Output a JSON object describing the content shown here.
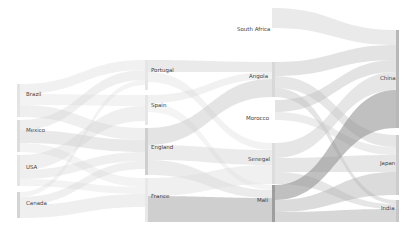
{
  "chart_data": {
    "type": "sankey",
    "title": "",
    "columns": [
      [
        "Brazil",
        "Mexico",
        "USA",
        "Canada"
      ],
      [
        "Portugal",
        "Spain",
        "England",
        "France"
      ],
      [
        "South Africa",
        "Angola",
        "Morocco",
        "Senegal",
        "Mali"
      ],
      [
        "China",
        "Japan",
        "India"
      ]
    ],
    "nodes": [
      {
        "name": "Brazil",
        "col": 0,
        "x": 17,
        "y0": 84,
        "y1": 117,
        "color": "#e4e4e4",
        "lx": 26,
        "ly": 94
      },
      {
        "name": "Mexico",
        "col": 0,
        "x": 17,
        "y0": 120,
        "y1": 152,
        "color": "#dcdcdc",
        "lx": 26,
        "ly": 130
      },
      {
        "name": "USA",
        "col": 0,
        "x": 17,
        "y0": 155,
        "y1": 186,
        "color": "#e4e4e4",
        "lx": 26,
        "ly": 167
      },
      {
        "name": "Canada",
        "col": 0,
        "x": 17,
        "y0": 192,
        "y1": 218,
        "color": "#d4d4d4",
        "lx": 26,
        "ly": 203
      },
      {
        "name": "Portugal",
        "col": 1,
        "x": 145,
        "y0": 60,
        "y1": 90,
        "color": "#e6e6e6",
        "lx": 151,
        "ly": 70
      },
      {
        "name": "Spain",
        "col": 1,
        "x": 145,
        "y0": 95,
        "y1": 125,
        "color": "#e6e6e6",
        "lx": 151,
        "ly": 105
      },
      {
        "name": "England",
        "col": 1,
        "x": 145,
        "y0": 128,
        "y1": 175,
        "color": "#cfcfcf",
        "lx": 151,
        "ly": 147
      },
      {
        "name": "France",
        "col": 1,
        "x": 145,
        "y0": 178,
        "y1": 222,
        "color": "#e8e8e8",
        "lx": 151,
        "ly": 196
      },
      {
        "name": "South Africa",
        "col": 2,
        "x": 272,
        "y0": 28,
        "y1": 28,
        "color": "#ffffff",
        "lx": 237,
        "ly": 29
      },
      {
        "name": "Angola",
        "col": 2,
        "x": 272,
        "y0": 62,
        "y1": 97,
        "color": "#d8d8d8",
        "lx": 249,
        "ly": 76
      },
      {
        "name": "Morocco",
        "col": 2,
        "x": 272,
        "y0": 118,
        "y1": 118,
        "color": "#ffffff",
        "lx": 246,
        "ly": 118
      },
      {
        "name": "Senegal",
        "col": 2,
        "x": 272,
        "y0": 143,
        "y1": 184,
        "color": "#dddddd",
        "lx": 248,
        "ly": 159
      },
      {
        "name": "Mali",
        "col": 2,
        "x": 272,
        "y0": 185,
        "y1": 222,
        "color": "#9e9e9e",
        "lx": 257,
        "ly": 200
      },
      {
        "name": "China",
        "col": 3,
        "x": 396,
        "y0": 30,
        "y1": 128,
        "color": "#b8b8b8",
        "lx": 380,
        "ly": 78
      },
      {
        "name": "Japan",
        "col": 3,
        "x": 396,
        "y0": 135,
        "y1": 195,
        "color": "#cdcdcd",
        "lx": 380,
        "ly": 163
      },
      {
        "name": "India",
        "col": 3,
        "x": 396,
        "y0": 200,
        "y1": 222,
        "color": "#c6c6c6",
        "lx": 381,
        "ly": 208
      }
    ],
    "links": [
      {
        "source": "Brazil",
        "target": "Portugal",
        "sx": 20,
        "tx": 145,
        "s0": 84,
        "s1": 94,
        "t0": 60,
        "t1": 70,
        "color": "#d8d8d8",
        "opacity": 0.35
      },
      {
        "source": "Brazil",
        "target": "Spain",
        "sx": 20,
        "tx": 145,
        "s0": 94,
        "s1": 105,
        "t0": 95,
        "t1": 106,
        "color": "#d8d8d8",
        "opacity": 0.3
      },
      {
        "source": "Brazil",
        "target": "England",
        "sx": 20,
        "tx": 145,
        "s0": 105,
        "s1": 117,
        "t0": 128,
        "t1": 140,
        "color": "#d0d0d0",
        "opacity": 0.35
      },
      {
        "source": "Mexico",
        "target": "Portugal",
        "sx": 20,
        "tx": 145,
        "s0": 120,
        "s1": 130,
        "t0": 70,
        "t1": 80,
        "color": "#d0d0d0",
        "opacity": 0.35
      },
      {
        "source": "Mexico",
        "target": "England",
        "sx": 20,
        "tx": 145,
        "s0": 130,
        "s1": 143,
        "t0": 140,
        "t1": 152,
        "color": "#c8c8c8",
        "opacity": 0.4
      },
      {
        "source": "Mexico",
        "target": "France",
        "sx": 20,
        "tx": 145,
        "s0": 143,
        "s1": 152,
        "t0": 178,
        "t1": 187,
        "color": "#d8d8d8",
        "opacity": 0.3
      },
      {
        "source": "USA",
        "target": "Spain",
        "sx": 20,
        "tx": 145,
        "s0": 155,
        "s1": 170,
        "t0": 106,
        "t1": 121,
        "color": "#d0d0d0",
        "opacity": 0.35
      },
      {
        "source": "USA",
        "target": "England",
        "sx": 20,
        "tx": 145,
        "s0": 170,
        "s1": 179,
        "t0": 152,
        "t1": 161,
        "color": "#d0d0d0",
        "opacity": 0.35
      },
      {
        "source": "USA",
        "target": "France",
        "sx": 20,
        "tx": 145,
        "s0": 179,
        "s1": 186,
        "t0": 187,
        "t1": 194,
        "color": "#d8d8d8",
        "opacity": 0.3
      },
      {
        "source": "Canada",
        "target": "Portugal",
        "sx": 20,
        "tx": 145,
        "s0": 192,
        "s1": 197,
        "t0": 80,
        "t1": 85,
        "color": "#d8d8d8",
        "opacity": 0.3
      },
      {
        "source": "Canada",
        "target": "England",
        "sx": 20,
        "tx": 145,
        "s0": 197,
        "s1": 205,
        "t0": 161,
        "t1": 169,
        "color": "#d0d0d0",
        "opacity": 0.35
      },
      {
        "source": "Canada",
        "target": "France",
        "sx": 20,
        "tx": 145,
        "s0": 205,
        "s1": 218,
        "t0": 194,
        "t1": 207,
        "color": "#d8d8d8",
        "opacity": 0.4
      },
      {
        "source": "Portugal",
        "target": "Angola",
        "sx": 148,
        "tx": 272,
        "s0": 60,
        "s1": 72,
        "t0": 62,
        "t1": 72,
        "color": "#d0d0d0",
        "opacity": 0.45
      },
      {
        "source": "Portugal",
        "target": "Senegal",
        "sx": 148,
        "tx": 272,
        "s0": 72,
        "s1": 82,
        "t0": 143,
        "t1": 150,
        "color": "#dadada",
        "opacity": 0.35
      },
      {
        "source": "Spain",
        "target": "Angola",
        "sx": 148,
        "tx": 272,
        "s0": 95,
        "s1": 103,
        "t0": 72,
        "t1": 79,
        "color": "#d8d8d8",
        "opacity": 0.35
      },
      {
        "source": "Spain",
        "target": "Mali",
        "sx": 148,
        "tx": 272,
        "s0": 103,
        "s1": 112,
        "t0": 185,
        "t1": 190,
        "color": "#dadada",
        "opacity": 0.3
      },
      {
        "source": "England",
        "target": "Angola",
        "sx": 148,
        "tx": 272,
        "s0": 128,
        "s1": 145,
        "t0": 79,
        "t1": 97,
        "color": "#c4c4c4",
        "opacity": 0.45
      },
      {
        "source": "England",
        "target": "Senegal",
        "sx": 148,
        "tx": 272,
        "s0": 145,
        "s1": 160,
        "t0": 150,
        "t1": 165,
        "color": "#cccccc",
        "opacity": 0.4
      },
      {
        "source": "England",
        "target": "Mali",
        "sx": 148,
        "tx": 272,
        "s0": 160,
        "s1": 175,
        "t0": 190,
        "t1": 198,
        "color": "#cccccc",
        "opacity": 0.4
      },
      {
        "source": "France",
        "target": "Senegal",
        "sx": 148,
        "tx": 272,
        "s0": 178,
        "s1": 196,
        "t0": 165,
        "t1": 184,
        "color": "#dddddd",
        "opacity": 0.45
      },
      {
        "source": "France",
        "target": "Mali",
        "sx": 148,
        "tx": 272,
        "s0": 196,
        "s1": 222,
        "t0": 198,
        "t1": 222,
        "color": "#a8a8a8",
        "opacity": 0.55
      },
      {
        "source": "South Africa",
        "target": "China",
        "sx": 272,
        "tx": 396,
        "s0": 8,
        "s1": 28,
        "t0": 30,
        "t1": 45,
        "color": "#d0d0d0",
        "opacity": 0.45
      },
      {
        "source": "Angola",
        "target": "China",
        "sx": 275,
        "tx": 396,
        "s0": 62,
        "s1": 76,
        "t0": 45,
        "t1": 60,
        "color": "#c8c8c8",
        "opacity": 0.5
      },
      {
        "source": "Angola",
        "target": "Japan",
        "sx": 275,
        "tx": 396,
        "s0": 76,
        "s1": 88,
        "t0": 135,
        "t1": 147,
        "color": "#c8c8c8",
        "opacity": 0.45
      },
      {
        "source": "Angola",
        "target": "India",
        "sx": 275,
        "tx": 396,
        "s0": 88,
        "s1": 97,
        "t0": 200,
        "t1": 204,
        "color": "#bcbcbc",
        "opacity": 0.4
      },
      {
        "source": "Morocco",
        "target": "China",
        "sx": 275,
        "tx": 396,
        "s0": 100,
        "s1": 112,
        "t0": 60,
        "t1": 72,
        "color": "#b8b8b8",
        "opacity": 0.4
      },
      {
        "source": "Morocco",
        "target": "Japan",
        "sx": 275,
        "tx": 396,
        "s0": 112,
        "s1": 120,
        "t0": 147,
        "t1": 155,
        "color": "#c8c8c8",
        "opacity": 0.35
      },
      {
        "source": "Senegal",
        "target": "China",
        "sx": 275,
        "tx": 396,
        "s0": 143,
        "s1": 158,
        "t0": 72,
        "t1": 90,
        "color": "#c8c8c8",
        "opacity": 0.45
      },
      {
        "source": "Senegal",
        "target": "Japan",
        "sx": 275,
        "tx": 396,
        "s0": 158,
        "s1": 172,
        "t0": 155,
        "t1": 172,
        "color": "#c8c8c8",
        "opacity": 0.45
      },
      {
        "source": "Senegal",
        "target": "India",
        "sx": 275,
        "tx": 396,
        "s0": 172,
        "s1": 184,
        "t0": 204,
        "t1": 209,
        "color": "#c0c0c0",
        "opacity": 0.4
      },
      {
        "source": "Mali",
        "target": "China",
        "sx": 275,
        "tx": 396,
        "s0": 185,
        "s1": 200,
        "t0": 90,
        "t1": 128,
        "color": "#8c8c8c",
        "opacity": 0.55
      },
      {
        "source": "Mali",
        "target": "Japan",
        "sx": 275,
        "tx": 396,
        "s0": 200,
        "s1": 212,
        "t0": 172,
        "t1": 195,
        "color": "#b0b0b0",
        "opacity": 0.45
      },
      {
        "source": "Mali",
        "target": "India",
        "sx": 275,
        "tx": 396,
        "s0": 212,
        "s1": 222,
        "t0": 209,
        "t1": 222,
        "color": "#b0b0b0",
        "opacity": 0.5
      }
    ]
  }
}
